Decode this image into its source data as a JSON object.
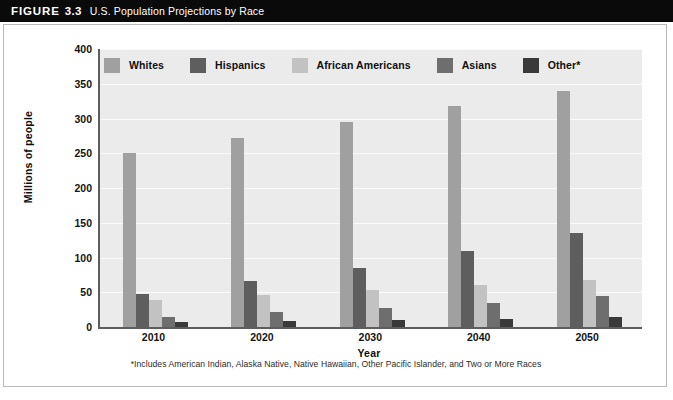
{
  "header": {
    "figure_word": "FIGURE",
    "figure_number": "3.3",
    "title": "U.S. Population Projections by Race",
    "background_color": "#0a0a0a",
    "text_color": "#ffffff"
  },
  "footnote": "*Includes American Indian, Alaska Native, Native Hawaiian, Other Pacific Islander, and Two or More Races",
  "legend": {
    "position": "top-inside",
    "items": [
      {
        "label": "Whites",
        "color": "#a0a0a0"
      },
      {
        "label": "Hispanics",
        "color": "#5e5e5e"
      },
      {
        "label": "African Americans",
        "color": "#c2c2c2"
      },
      {
        "label": "Asians",
        "color": "#6e6e6e"
      },
      {
        "label": "Other*",
        "color": "#3a3a3a"
      }
    ]
  },
  "chart_data": {
    "type": "bar",
    "title": "U.S. Population Projections by Race",
    "xlabel": "Year",
    "ylabel": "Millions of people",
    "categories": [
      "2010",
      "2020",
      "2030",
      "2040",
      "2050"
    ],
    "ylim": [
      0,
      400
    ],
    "yticks": [
      0,
      50,
      100,
      150,
      200,
      250,
      300,
      350,
      400
    ],
    "ytick_labels": [
      "0",
      "50",
      "100",
      "150",
      "200",
      "250",
      "300",
      "350",
      "400"
    ],
    "grid": true,
    "grid_axis": "y",
    "plot_background": "#ebebeb",
    "series": [
      {
        "name": "Whites",
        "color": "#a0a0a0",
        "values": [
          250,
          272,
          295,
          318,
          339
        ]
      },
      {
        "name": "Hispanics",
        "color": "#5e5e5e",
        "values": [
          47,
          66,
          85,
          110,
          135
        ]
      },
      {
        "name": "African Americans",
        "color": "#c2c2c2",
        "values": [
          39,
          46,
          53,
          60,
          67
        ]
      },
      {
        "name": "Asians",
        "color": "#6e6e6e",
        "values": [
          15,
          21,
          28,
          35,
          44
        ]
      },
      {
        "name": "Other*",
        "color": "#3a3a3a",
        "values": [
          7,
          8,
          10,
          12,
          14
        ]
      }
    ]
  }
}
